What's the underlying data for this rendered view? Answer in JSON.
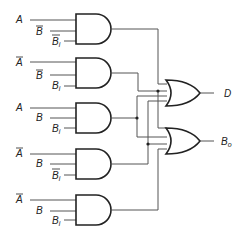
{
  "and_gates": [
    {
      "id": "and1",
      "inputs": [
        {
          "label": "A",
          "bar": false
        },
        {
          "label": "B",
          "bar": true
        },
        {
          "label": "B",
          "sub": "i",
          "bar": true
        }
      ]
    },
    {
      "id": "and2",
      "inputs": [
        {
          "label": "A",
          "bar": true
        },
        {
          "label": "B",
          "bar": true
        },
        {
          "label": "B",
          "sub": "i",
          "bar": false
        }
      ]
    },
    {
      "id": "and3",
      "inputs": [
        {
          "label": "A",
          "bar": false
        },
        {
          "label": "B",
          "bar": false
        },
        {
          "label": "B",
          "sub": "i",
          "bar": false
        }
      ]
    },
    {
      "id": "and4",
      "inputs": [
        {
          "label": "A",
          "bar": true
        },
        {
          "label": "B",
          "bar": false
        },
        {
          "label": "B",
          "sub": "i",
          "bar": true
        }
      ]
    },
    {
      "id": "and5",
      "inputs": [
        {
          "label": "A",
          "bar": true
        },
        {
          "label": "B",
          "bar": false
        },
        {
          "label": "B",
          "sub": "i",
          "bar": false
        }
      ]
    }
  ],
  "or_gates": [
    {
      "id": "or_d",
      "output": {
        "label": "D"
      }
    },
    {
      "id": "or_bo",
      "output": {
        "label": "B",
        "sub": "o"
      }
    }
  ],
  "labels": {
    "A": "A",
    "B": "B",
    "Bi_main": "B",
    "Bi_sub": "i",
    "D": "D",
    "Bo_main": "B",
    "Bo_sub": "o"
  }
}
